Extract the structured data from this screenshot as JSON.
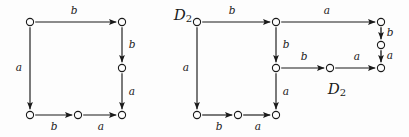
{
  "canvas": {
    "width": 409,
    "height": 137,
    "background": "#fdfdfd",
    "ink": "#1a1a1a"
  },
  "diagrams": [
    {
      "id": "left-diagram",
      "name": "commutative-square-left",
      "label": null,
      "nodes": [
        {
          "id": "L0",
          "x": 30,
          "y": 22,
          "r": 3.6
        },
        {
          "id": "L1",
          "x": 122,
          "y": 22,
          "r": 3.6
        },
        {
          "id": "L2",
          "x": 122,
          "y": 68,
          "r": 3.6
        },
        {
          "id": "L3",
          "x": 30,
          "y": 115,
          "r": 3.6
        },
        {
          "id": "L4",
          "x": 78,
          "y": 115,
          "r": 3.6
        },
        {
          "id": "L5",
          "x": 122,
          "y": 115,
          "r": 3.6
        }
      ],
      "edges": [
        {
          "from": "L0",
          "to": "L1",
          "label": "b",
          "label_x": 74,
          "label_y": 11,
          "dir": "right"
        },
        {
          "from": "L1",
          "to": "L2",
          "label": "b",
          "label_x": 132,
          "label_y": 45,
          "dir": "down"
        },
        {
          "from": "L0",
          "to": "L3",
          "label": "a",
          "label_x": 19,
          "label_y": 68,
          "dir": "down"
        },
        {
          "from": "L2",
          "to": "L5",
          "label": "a",
          "label_x": 132,
          "label_y": 92,
          "dir": "down"
        },
        {
          "from": "L3",
          "to": "L4",
          "label": "b",
          "label_x": 54,
          "label_y": 127,
          "dir": "right"
        },
        {
          "from": "L4",
          "to": "L5",
          "label": "a",
          "label_x": 101,
          "label_y": 127,
          "dir": "right"
        }
      ]
    },
    {
      "id": "right-diagram",
      "name": "commutative-diagram-right",
      "label_top": {
        "text": "D",
        "sub": "2",
        "x": 183,
        "y": 16
      },
      "label_inner": {
        "text": "D",
        "sub": "2",
        "x": 337,
        "y": 90
      },
      "nodes": [
        {
          "id": "R0",
          "x": 197,
          "y": 22,
          "r": 3.6
        },
        {
          "id": "R1",
          "x": 276,
          "y": 22,
          "r": 3.6
        },
        {
          "id": "R2",
          "x": 381,
          "y": 22,
          "r": 3.6
        },
        {
          "id": "R3",
          "x": 381,
          "y": 45,
          "r": 3.6
        },
        {
          "id": "R4",
          "x": 276,
          "y": 68,
          "r": 3.6
        },
        {
          "id": "R5",
          "x": 330,
          "y": 68,
          "r": 3.6
        },
        {
          "id": "R6",
          "x": 381,
          "y": 68,
          "r": 3.6
        },
        {
          "id": "R7",
          "x": 197,
          "y": 115,
          "r": 3.6
        },
        {
          "id": "R8",
          "x": 238,
          "y": 115,
          "r": 3.6
        },
        {
          "id": "R9",
          "x": 276,
          "y": 115,
          "r": 3.6
        }
      ],
      "edges": [
        {
          "from": "R0",
          "to": "R1",
          "label": "b",
          "label_x": 232,
          "label_y": 11,
          "dir": "right"
        },
        {
          "from": "R1",
          "to": "R2",
          "label": "a",
          "label_x": 327,
          "label_y": 11,
          "dir": "right"
        },
        {
          "from": "R2",
          "to": "R3",
          "label": "b",
          "label_x": 390,
          "label_y": 33,
          "dir": "down"
        },
        {
          "from": "R3",
          "to": "R6",
          "label": "a",
          "label_x": 390,
          "label_y": 56,
          "dir": "down"
        },
        {
          "from": "R1",
          "to": "R4",
          "label": "b",
          "label_x": 286,
          "label_y": 45,
          "dir": "down"
        },
        {
          "from": "R0",
          "to": "R7",
          "label": "a",
          "label_x": 186,
          "label_y": 68,
          "dir": "down"
        },
        {
          "from": "R4",
          "to": "R5",
          "label": "b",
          "label_x": 304,
          "label_y": 57,
          "dir": "right"
        },
        {
          "from": "R5",
          "to": "R6",
          "label": "a",
          "label_x": 357,
          "label_y": 57,
          "dir": "right"
        },
        {
          "from": "R4",
          "to": "R9",
          "label": "a",
          "label_x": 286,
          "label_y": 92,
          "dir": "down"
        },
        {
          "from": "R7",
          "to": "R8",
          "label": "b",
          "label_x": 219,
          "label_y": 127,
          "dir": "right"
        },
        {
          "from": "R8",
          "to": "R9",
          "label": "a",
          "label_x": 258,
          "label_y": 127,
          "dir": "right"
        }
      ]
    }
  ]
}
